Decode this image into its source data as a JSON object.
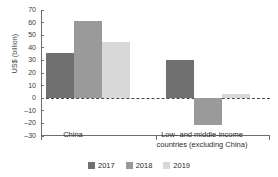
{
  "chart_data": {
    "type": "bar",
    "title": "",
    "xlabel": "",
    "ylabel": "US$ (billion)",
    "ylim": [
      -30,
      70
    ],
    "ytick_step": 10,
    "yticks": [
      70,
      60,
      50,
      40,
      30,
      20,
      10,
      0,
      -10,
      -20,
      -30
    ],
    "ytick_labels": [
      "70",
      "60",
      "50",
      "40",
      "30",
      "20",
      "10",
      "0",
      "–10",
      "–20",
      "–30"
    ],
    "grid": false,
    "zero_line": true,
    "legend_position": "bottom",
    "categories": [
      "China",
      "Low- and middle-income countries (excluding China)"
    ],
    "category_lines": [
      [
        "China"
      ],
      [
        "Low- and middle-income",
        "countries (excluding China)"
      ]
    ],
    "series": [
      {
        "name": "2017",
        "color": "#707070",
        "values": [
          36,
          30
        ]
      },
      {
        "name": "2018",
        "color": "#9a9a9a",
        "values": [
          61,
          -21
        ]
      },
      {
        "name": "2019",
        "color": "#d8d8d8",
        "values": [
          45,
          3
        ]
      }
    ]
  },
  "legend": {
    "items": [
      {
        "label": "2017",
        "color": "#707070"
      },
      {
        "label": "2018",
        "color": "#9a9a9a"
      },
      {
        "label": "2019",
        "color": "#d8d8d8"
      }
    ]
  },
  "axis": {
    "y_title": "US$ (billion)"
  }
}
